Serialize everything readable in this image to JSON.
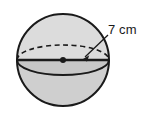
{
  "figure": {
    "name": "sphere-radius-diagram",
    "shape": "sphere",
    "label": "7 cm",
    "measurement": {
      "value": 7,
      "unit": "cm",
      "quantity": "radius"
    },
    "colors": {
      "outline": "#1a1a1a",
      "upper_fill": "#dcdcdc",
      "lower_fill": "#cfcfcf",
      "background": "#ffffff",
      "center_dot": "#1a1a1a",
      "leader_line": "#1a1a1a"
    },
    "geometry": {
      "center_x": 63,
      "center_y": 60,
      "radius": 46,
      "equator_ellipse_ry": 15,
      "leader_start_x": 108,
      "leader_start_y": 36,
      "leader_end_x": 84,
      "leader_end_y": 58
    }
  }
}
